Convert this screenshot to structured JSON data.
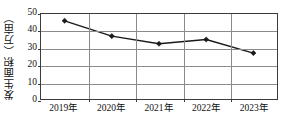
{
  "chart_data": {
    "type": "line",
    "title": "",
    "xlabel": "",
    "ylabel": "发生面积（万亩）",
    "categories": [
      "2019年",
      "2020年",
      "2021年",
      "2022年",
      "2023年"
    ],
    "values": [
      46,
      37,
      32.5,
      35,
      27
    ],
    "series": [
      {
        "name": "发生面积",
        "values": [
          46,
          37,
          32.5,
          35,
          27
        ]
      }
    ],
    "ylim": [
      0,
      50
    ],
    "yticks": [
      0,
      10,
      20,
      30,
      40,
      50
    ],
    "ytick_labels": [
      "0",
      "10",
      "20",
      "30",
      "40",
      "50"
    ],
    "grid": true,
    "grid_axis": "both",
    "legend": "none",
    "marker": "diamond",
    "line_color": "#1a1a1a",
    "marker_color": "#1a1a1a",
    "grid_color": "#8a8a8a",
    "frame_color": "#3b3b3b",
    "background": "#ffffff"
  }
}
